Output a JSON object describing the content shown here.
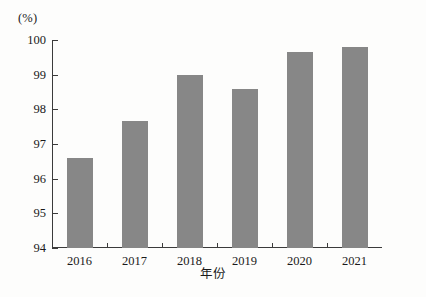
{
  "chart_data": {
    "type": "bar",
    "title": "",
    "subtitle": "",
    "unit_label": "(%)",
    "xlabel": "年份",
    "ylabel": "",
    "categories": [
      "2016",
      "2017",
      "2018",
      "2019",
      "2020",
      "2021"
    ],
    "values": [
      96.6,
      97.65,
      99.0,
      98.6,
      99.65,
      99.8
    ],
    "series": [
      {
        "name": "",
        "values": [
          96.6,
          97.65,
          99.0,
          98.6,
          99.65,
          99.8
        ]
      }
    ],
    "ylim": [
      94,
      100
    ],
    "yticks": [
      94,
      95,
      96,
      97,
      98,
      99,
      100
    ],
    "ytick_labels": [
      "94",
      "95",
      "96",
      "97",
      "98",
      "99",
      "100"
    ],
    "xtick_labels": [
      "2016",
      "2017",
      "2018",
      "2019",
      "2020",
      "2021"
    ],
    "grid": false,
    "legend": false,
    "legend_position": "none",
    "bar_color": "#878787",
    "axis_color": "#3b3b3b",
    "background_color": "#fdfdfc"
  }
}
